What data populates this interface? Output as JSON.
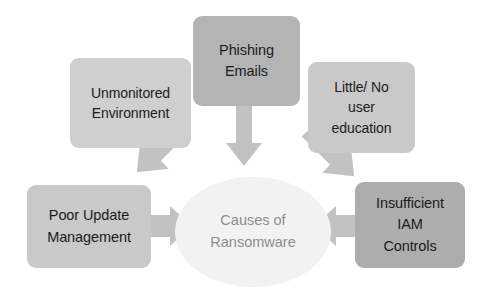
{
  "diagram": {
    "type": "hub-and-spoke cause diagram",
    "background_color": "#ffffff",
    "center": {
      "label_line1": "Causes of",
      "label_line2": "Ransomware",
      "shape": "ellipse",
      "fill_color": "#f2f2f2",
      "text_color": "#8d8d8d"
    },
    "nodes": [
      {
        "id": "phishing",
        "label_line1": "Phishing",
        "label_line2": "Emails",
        "shape": "rounded-rectangle",
        "fill_color": "#b4b4b4",
        "text_color": "#1b1b1b",
        "position": "top-center",
        "arrow_direction": "down"
      },
      {
        "id": "unmonitored",
        "label_line1": "Unmonitored",
        "label_line2": "Environment",
        "shape": "rounded-rectangle",
        "fill_color": "#cfcfcf",
        "text_color": "#1b1b1b",
        "position": "top-left",
        "arrow_direction": "down-right"
      },
      {
        "id": "education",
        "label_line1": "Little/ No",
        "label_line2": "user",
        "label_line3": "education",
        "shape": "rounded-rectangle",
        "fill_color": "#c9c9c9",
        "text_color": "#1b1b1b",
        "position": "top-right",
        "arrow_direction": "down-left"
      },
      {
        "id": "update",
        "label_line1": "Poor Update",
        "label_line2": "Management",
        "shape": "rounded-rectangle",
        "fill_color": "#c9c9c9",
        "text_color": "#1b1b1b",
        "position": "bottom-left",
        "arrow_direction": "right"
      },
      {
        "id": "iam",
        "label_line1": "Insufficient",
        "label_line2": "IAM",
        "label_line3": "Controls",
        "shape": "rounded-rectangle",
        "fill_color": "#adadad",
        "text_color": "#1b1b1b",
        "position": "bottom-right",
        "arrow_direction": "left"
      }
    ],
    "arrows": {
      "fill_color": "#c2c2c2",
      "count": 5
    }
  }
}
